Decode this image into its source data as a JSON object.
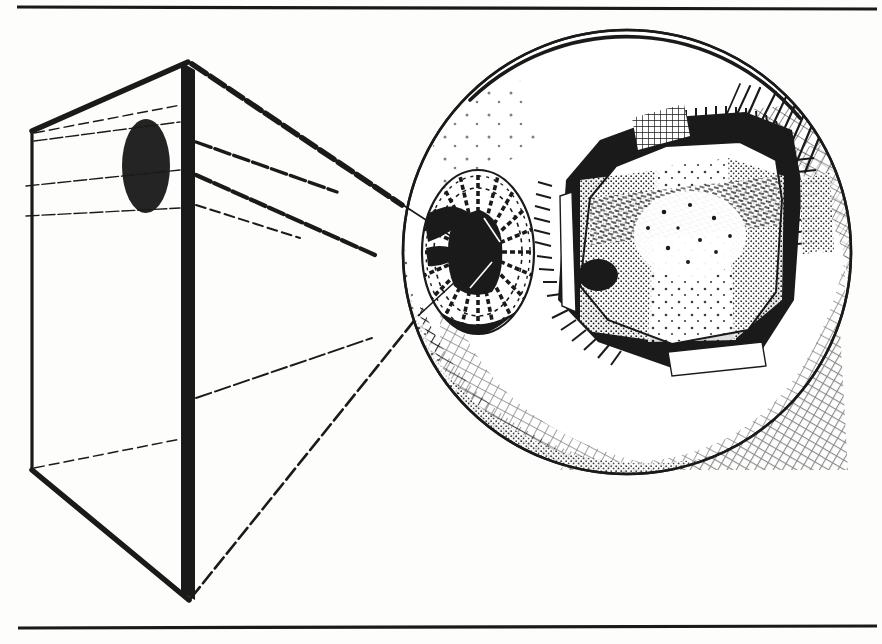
{
  "document": {
    "type": "scanned-book-illustration",
    "medium": "pen-and-ink line drawing",
    "page_background": "#fdfdfc",
    "ink_color": "#1a1a1a",
    "width": 882,
    "height": 644
  },
  "rules": {
    "top_rule": {
      "x1": 17,
      "y1": 7,
      "x2": 877,
      "y2": 9,
      "thickness": 3
    },
    "bottom_rule": {
      "x1": 18,
      "y1": 628,
      "x2": 877,
      "y2": 626,
      "thickness": 3
    }
  },
  "figure": {
    "title": "Perspective viewing box and sectioned eyeball",
    "elements": [
      {
        "name": "viewing-box",
        "label": "perspective frustum / viewing box",
        "apex": {
          "x": 188,
          "y": 62
        },
        "left_top": {
          "x": 32,
          "y": 131
        },
        "left_bottom": {
          "x": 32,
          "y": 470
        },
        "bottom_apex": {
          "x": 189,
          "y": 600
        }
      },
      {
        "name": "target-ellipse",
        "label": "dark elliptical object inside box",
        "cx": 146,
        "cy": 166,
        "rx": 24,
        "ry": 47
      },
      {
        "name": "picture-plane-bar",
        "label": "thick vertical picture-plane edge",
        "x": 182,
        "y_top": 62,
        "y_bottom": 600,
        "width": 13
      },
      {
        "name": "sight-lines",
        "label": "converging lines of sight from box to eye",
        "count": 6
      },
      {
        "name": "eyeball",
        "label": "sectioned eyeball sphere",
        "cx": 627,
        "cy": 252,
        "rx": 224,
        "ry": 222
      },
      {
        "name": "iris",
        "label": "iris with radial striations",
        "cx": 478,
        "cy": 252,
        "rx": 56,
        "ry": 82
      },
      {
        "name": "pupil",
        "label": "pupil",
        "cx": 473,
        "cy": 256,
        "rx": 26,
        "ry": 34
      },
      {
        "name": "lens-body",
        "label": "ciliary body / lens capsule polygon",
        "cx": 690,
        "cy": 245
      },
      {
        "name": "lens-inclusion",
        "label": "small dark ellipse inside lens body",
        "cx": 598,
        "cy": 275,
        "rx": 20,
        "ry": 16
      },
      {
        "name": "retina-hatching",
        "label": "crosshatched retina / posterior shading"
      }
    ]
  },
  "chart_data": null
}
